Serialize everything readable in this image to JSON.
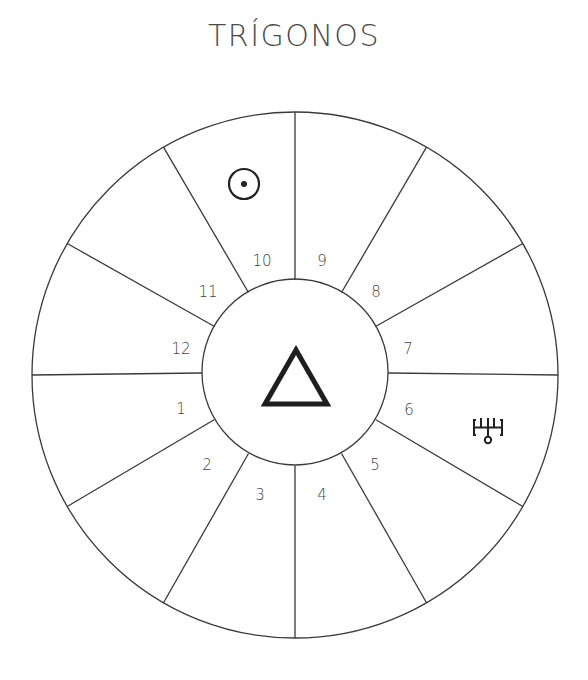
{
  "title": "TRÍGONOS",
  "wheel": {
    "center": [
      295,
      375
    ],
    "outer_radius": 263,
    "inner_radius": 93,
    "line_color": "#3a3a3a",
    "houses": [
      {
        "number": "1",
        "x": 181,
        "y": 414
      },
      {
        "number": "2",
        "x": 207,
        "y": 470
      },
      {
        "number": "3",
        "x": 260,
        "y": 500
      },
      {
        "number": "4",
        "x": 322,
        "y": 500
      },
      {
        "number": "5",
        "x": 375,
        "y": 470
      },
      {
        "number": "6",
        "x": 409,
        "y": 415
      },
      {
        "number": "7",
        "x": 408,
        "y": 354
      },
      {
        "number": "8",
        "x": 376,
        "y": 297
      },
      {
        "number": "9",
        "x": 322,
        "y": 266
      },
      {
        "number": "10",
        "x": 262,
        "y": 266
      },
      {
        "number": "11",
        "x": 208,
        "y": 297
      },
      {
        "number": "12",
        "x": 181,
        "y": 354
      }
    ],
    "center_symbol": "triangle-icon",
    "planets": [
      {
        "name": "sun-icon",
        "house": "10",
        "x": 244,
        "y": 184
      },
      {
        "name": "uranus-icon",
        "house": "6",
        "x": 488,
        "y": 430
      }
    ]
  }
}
